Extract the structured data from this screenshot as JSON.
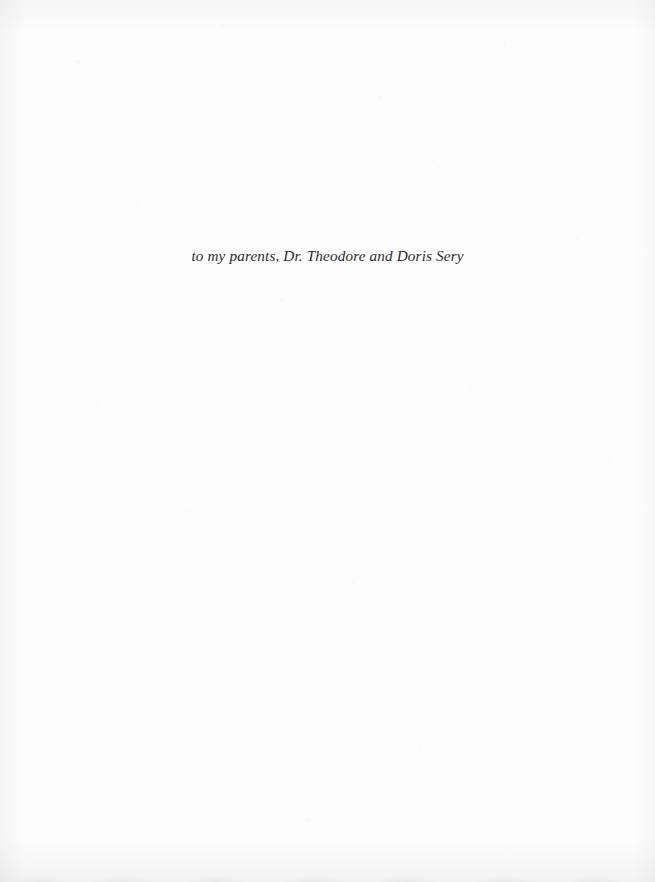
{
  "page": {
    "kind": "book-dedication-page",
    "background_color": "#fdfdfd",
    "ink_color": "#2b2b2d"
  },
  "dedication": {
    "text": "to my parents, Dr. Theodore and Doris Sery"
  }
}
